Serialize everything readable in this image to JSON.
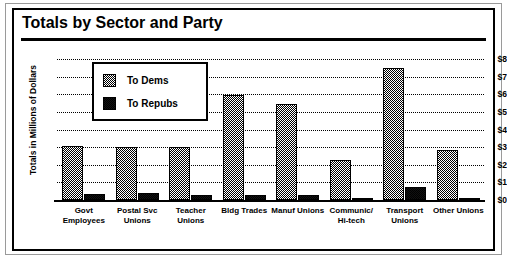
{
  "frame": {
    "border_color": "#000000",
    "background": "#ffffff"
  },
  "title": "Totals by Sector and Party",
  "chart_data": {
    "type": "bar",
    "title": "Totals by Sector and Party",
    "xlabel": "",
    "ylabel": "Totals in Millions of Dollars",
    "categories": [
      "Govt Employees",
      "Postal Svc Unions",
      "Teacher Unions",
      "Bldg Trades",
      "Manuf Unions",
      "Communic/ Hi-tech",
      "Transport Unions",
      "Other Unions"
    ],
    "category_lines": [
      [
        "Govt",
        "Employees"
      ],
      [
        "Postal Svc",
        "Unions"
      ],
      [
        "Teacher",
        "Unions"
      ],
      [
        "Bldg Trades",
        ""
      ],
      [
        "Manuf Unions",
        ""
      ],
      [
        "Communic/",
        "Hi-tech"
      ],
      [
        "Transport",
        "Unions"
      ],
      [
        "Other Unions",
        ""
      ]
    ],
    "series": [
      {
        "name": "To Dems",
        "color": "#b8b8b8",
        "pattern": "checker-50",
        "values": [
          3.05,
          3.0,
          3.0,
          5.95,
          5.45,
          2.25,
          7.5,
          2.85
        ]
      },
      {
        "name": "To Repubs",
        "color": "#000000",
        "pattern": "solid-black",
        "values": [
          0.35,
          0.4,
          0.3,
          0.3,
          0.3,
          0.1,
          0.75,
          0.12
        ]
      }
    ],
    "ylim": [
      0,
      8
    ],
    "ytick_values": [
      8,
      7,
      6,
      5,
      4,
      3,
      2,
      1,
      0
    ],
    "ytick_labels": [
      "$8",
      "$7",
      "$6",
      "$5",
      "$4",
      "$3",
      "$2",
      "$1",
      "$0"
    ],
    "grid": true,
    "grid_style": "dotted-horizontal",
    "legend_position": "upper-left-inset"
  },
  "legend": {
    "items": [
      {
        "label": "To Dems"
      },
      {
        "label": "To Repubs"
      }
    ]
  }
}
